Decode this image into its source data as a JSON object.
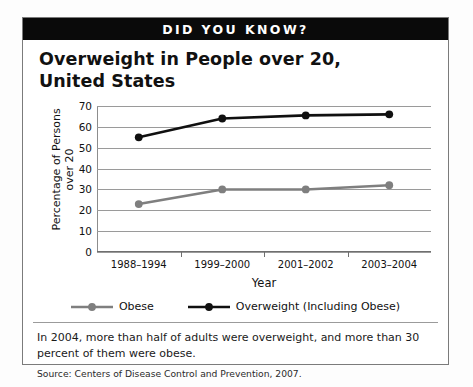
{
  "banner": {
    "label": "DID YOU KNOW?"
  },
  "title": {
    "line1": "Overweight in People over 20,",
    "line2": "United States"
  },
  "caption": {
    "text": "In 2004, more than half of adults were overweight, and more than 30 percent of them were obese."
  },
  "source": {
    "text": "Source: Centers of Disease Control and Prevention, 2007."
  },
  "colors": {
    "banner_background": "#0a0a0a",
    "banner_text": "#ffffff",
    "obese_series": "#7f7f7f",
    "overweight_series": "#101010",
    "gridline": "#9a9a9a",
    "card_border": "#7b7b7b"
  },
  "chart_data": {
    "type": "line",
    "title": "Overweight in People over 20, United States",
    "xlabel": "Year",
    "ylabel": "Percentage of Persons over 20",
    "categories": [
      "1988–1994",
      "1999–2000",
      "2001–2002",
      "2003–2004"
    ],
    "ylim": [
      0,
      70
    ],
    "yticks": [
      0,
      10,
      20,
      30,
      40,
      50,
      60,
      70
    ],
    "grid": true,
    "legend_position": "bottom",
    "series": [
      {
        "name": "Obese",
        "color": "#7f7f7f",
        "values": [
          23,
          30,
          30,
          32
        ]
      },
      {
        "name": "Overweight (Including Obese)",
        "color": "#101010",
        "values": [
          55,
          64,
          65.5,
          66
        ]
      }
    ]
  }
}
